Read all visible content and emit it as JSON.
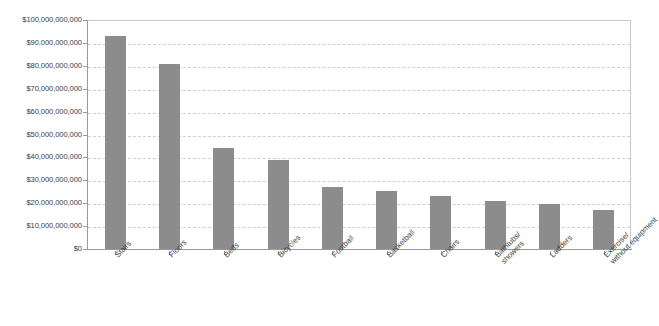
{
  "chart_data": {
    "type": "bar",
    "title": "",
    "subtitle": "",
    "xlabel": "",
    "ylabel": "",
    "categories": [
      "Stairs",
      "Floors",
      "Beds",
      "Bicycles",
      "Football",
      "Basketball",
      "Chairs",
      "Bathtubs/showers",
      "Ladders",
      "Exercise/without equipment"
    ],
    "category_lines": [
      [
        "Stairs"
      ],
      [
        "Floors"
      ],
      [
        "Beds"
      ],
      [
        "Bicycles"
      ],
      [
        "Football"
      ],
      [
        "Basketball"
      ],
      [
        "Chairs"
      ],
      [
        "Bathtubs/",
        "showers"
      ],
      [
        "Ladders"
      ],
      [
        "Exercise/",
        "without equipment"
      ]
    ],
    "values": [
      93000000000,
      81000000000,
      44000000000,
      39000000000,
      27000000000,
      25500000000,
      23000000000,
      21000000000,
      19500000000,
      17000000000
    ],
    "ylim": [
      0,
      100000000000
    ],
    "ytick_values": [
      0,
      10000000000,
      20000000000,
      30000000000,
      40000000000,
      50000000000,
      60000000000,
      70000000000,
      80000000000,
      90000000000,
      100000000000
    ],
    "ytick_labels": [
      "$0",
      "$10,000,000,000",
      "$20,000,000,000",
      "$30,000,000,000",
      "$40,000,000,000",
      "$50,000,000,000",
      "$60,000,000,000",
      "$70,000,000,000",
      "$80,000,000,000",
      "$90,000,000,000",
      "$100,000,000,000"
    ],
    "grid": true,
    "grid_style": "dashed-horizontal",
    "legend": null,
    "legend_position": "none",
    "bar_color": "#8c8c8c",
    "grid_color": "#cfcfcf",
    "axis_color": "#9a9a9a",
    "text_color": "#3b3b3b",
    "background": "#ffffff"
  }
}
